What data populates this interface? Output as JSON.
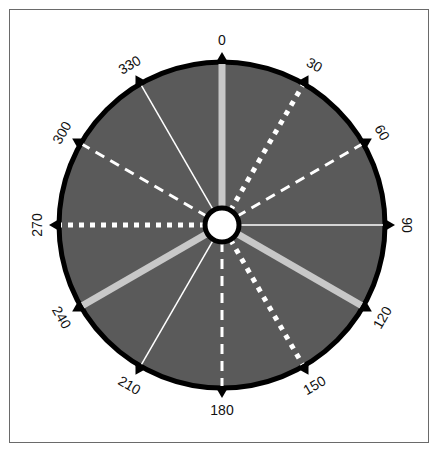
{
  "diagram": {
    "type": "compass-rose",
    "center": [
      222,
      225
    ],
    "outer_radius": 163,
    "hub_radius": 17,
    "colors": {
      "face": "#5a5a5a",
      "ring": "#000000",
      "hub_fill": "#ffffff",
      "hub_border": "#000000",
      "light_ray": "#c8c8c8",
      "white_ray": "#ffffff",
      "frame": "#6a6a6a"
    },
    "rays": [
      {
        "angle": 0,
        "label": "0",
        "style": "solid-thick-gray"
      },
      {
        "angle": 30,
        "label": "30",
        "style": "dotted-white"
      },
      {
        "angle": 60,
        "label": "60",
        "style": "dashed-white"
      },
      {
        "angle": 90,
        "label": "90",
        "style": "thin-white"
      },
      {
        "angle": 120,
        "label": "120",
        "style": "solid-thick-gray"
      },
      {
        "angle": 150,
        "label": "150",
        "style": "dotted-white"
      },
      {
        "angle": 180,
        "label": "180",
        "style": "dashed-white"
      },
      {
        "angle": 210,
        "label": "210",
        "style": "thin-white"
      },
      {
        "angle": 240,
        "label": "240",
        "style": "solid-thick-gray"
      },
      {
        "angle": 270,
        "label": "270",
        "style": "dotted-white"
      },
      {
        "angle": 300,
        "label": "300",
        "style": "dashed-white"
      },
      {
        "angle": 330,
        "label": "330",
        "style": "thin-white"
      }
    ]
  }
}
